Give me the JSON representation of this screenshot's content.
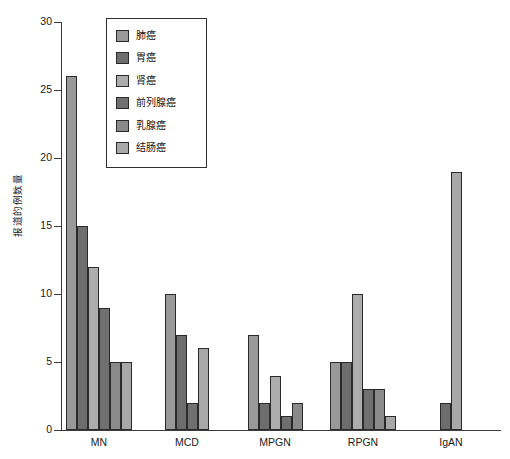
{
  "chart_data": {
    "type": "bar",
    "title": "",
    "xlabel": "",
    "ylabel": "报道的例数量",
    "ylim": [
      0,
      30
    ],
    "ytick_values": [
      0,
      5,
      10,
      15,
      20,
      25,
      30
    ],
    "ytick_labels": [
      "0",
      "5",
      "10",
      "15",
      "20",
      "25",
      "30"
    ],
    "grid": false,
    "legend_position": "upper-left-inside",
    "categories": [
      "MN",
      "MCD",
      "MPGN",
      "RPGN",
      "IgAN"
    ],
    "series": [
      {
        "name": "肺癌",
        "color": "#999999",
        "values": [
          26,
          10,
          7,
          5,
          null
        ]
      },
      {
        "name": "胃癌",
        "color": "#6e6e6e",
        "values": [
          15,
          7,
          2,
          5,
          2
        ]
      },
      {
        "name": "肾癌",
        "color": "#adadad",
        "values": [
          12,
          null,
          4,
          10,
          null
        ]
      },
      {
        "name": "前列腺癌",
        "color": "#707070",
        "values": [
          9,
          2,
          1,
          3,
          null
        ]
      },
      {
        "name": "乳腺癌",
        "color": "#8a8a8a",
        "values": [
          5,
          null,
          2,
          3,
          null
        ]
      },
      {
        "name": "结肠癌",
        "color": "#a8a8a8",
        "values": [
          5,
          6,
          null,
          1,
          19
        ]
      }
    ]
  },
  "legend": {
    "items": [
      {
        "label": "肺癌"
      },
      {
        "label": "胃癌"
      },
      {
        "label": "肾癌"
      },
      {
        "label": "前列腺癌"
      },
      {
        "label": "乳腺癌"
      },
      {
        "label": "结肠癌"
      }
    ]
  },
  "axes": {
    "y_title": "报道的例数量",
    "y_labels": [
      "30",
      "25",
      "20",
      "15",
      "10",
      "5",
      "0"
    ],
    "x_labels": [
      "MN",
      "MCD",
      "MPGN",
      "RPGN",
      "IgAN"
    ]
  }
}
